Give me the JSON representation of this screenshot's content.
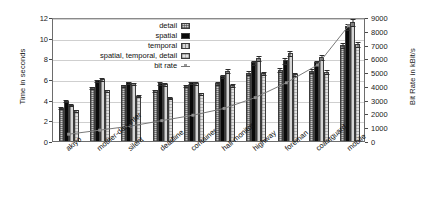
{
  "chart_data": {
    "type": "bar",
    "title": "",
    "subtitle": "",
    "xlabel": "",
    "ylabel": "Time in seconds",
    "y2label": "Bit Rate in kBit/s",
    "ylim": [
      0,
      12
    ],
    "y2lim": [
      0,
      9000
    ],
    "yticks": [
      0,
      2,
      4,
      6,
      8,
      10,
      12
    ],
    "y2ticks": [
      0,
      1000,
      2000,
      3000,
      4000,
      5000,
      6000,
      7000,
      8000,
      9000
    ],
    "grid": true,
    "legend_position": "upper center",
    "categories": [
      "akiyo",
      "mother-daughter",
      "silent",
      "deadline",
      "container",
      "hall-monitor",
      "highway",
      "foreman",
      "coastguard",
      "mobile"
    ],
    "series": [
      {
        "name": "detail",
        "axis": "left",
        "values": [
          3.2,
          5.2,
          5.4,
          4.9,
          5.4,
          5.6,
          6.6,
          6.9,
          6.8,
          9.3
        ],
        "errors": [
          0.1,
          0.15,
          0.15,
          0.15,
          0.15,
          0.2,
          0.25,
          0.25,
          0.25,
          0.3
        ]
      },
      {
        "name": "spatial",
        "axis": "left",
        "values": [
          3.9,
          5.9,
          5.7,
          5.6,
          5.7,
          6.3,
          7.6,
          7.8,
          7.6,
          11.1
        ],
        "errors": [
          0.1,
          0.15,
          0.15,
          0.2,
          0.15,
          0.2,
          0.25,
          0.3,
          0.25,
          0.35
        ]
      },
      {
        "name": "temporal",
        "axis": "left",
        "values": [
          3.5,
          6.0,
          5.6,
          5.5,
          5.6,
          6.8,
          8.0,
          8.5,
          8.1,
          11.5
        ],
        "errors": [
          0.15,
          0.15,
          0.15,
          0.2,
          0.2,
          0.25,
          0.3,
          0.3,
          0.3,
          0.4
        ]
      },
      {
        "name": "spatial, temporal, detail",
        "axis": "left",
        "values": [
          3.0,
          4.9,
          4.4,
          4.2,
          4.6,
          5.4,
          6.6,
          6.5,
          6.7,
          9.4
        ],
        "errors": [
          0.1,
          0.15,
          0.1,
          0.15,
          0.15,
          0.2,
          0.2,
          0.2,
          0.25,
          0.3
        ]
      },
      {
        "name": "bit rate",
        "axis": "right",
        "values": [
          500,
          800,
          1100,
          1500,
          1900,
          2400,
          3200,
          4300,
          5600,
          8500
        ]
      }
    ]
  },
  "legend": {
    "items": [
      {
        "label": "detail",
        "marker": "hatched-swatch"
      },
      {
        "label": "spatial",
        "marker": "solid-black-swatch"
      },
      {
        "label": "temporal",
        "marker": "vertical-hatch-swatch"
      },
      {
        "label": "spatial, temporal, detail",
        "marker": "light-hatch-swatch"
      },
      {
        "label": "bit rate",
        "marker": "line-marker"
      }
    ]
  },
  "colors": {
    "detail": "#c9c9c9",
    "spatial": "#0a0a0a",
    "temporal": "#d6d6d6",
    "spatial_temporal_detail": "#e2e2e2",
    "bit_rate_line": "#777777",
    "grid": "#cfcfcf",
    "frame": "#6d6d6d"
  }
}
